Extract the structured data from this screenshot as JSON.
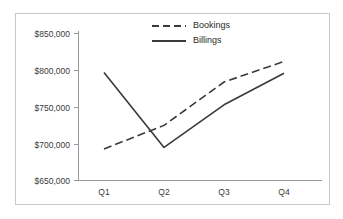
{
  "chart_data": {
    "type": "line",
    "title": "",
    "xlabel": "",
    "ylabel": "",
    "categories": [
      "Q1",
      "Q2",
      "Q3",
      "Q4"
    ],
    "ylim": [
      650000,
      850000
    ],
    "y_ticks": [
      850000,
      800000,
      750000,
      700000,
      650000
    ],
    "y_tick_labels": [
      "$850,000",
      "$800,000",
      "$750,000",
      "$700,000",
      "$650,000"
    ],
    "x_tick_labels": [
      "Q1",
      "Q2",
      "Q3",
      "Q4"
    ],
    "grid": false,
    "legend_position": "top-center",
    "series": [
      {
        "name": "Bookings",
        "style": "dashed",
        "color": "#3a3a3a",
        "values": [
          693000,
          725000,
          784000,
          812000
        ]
      },
      {
        "name": "Billings",
        "style": "solid",
        "color": "#3a3a3a",
        "values": [
          797000,
          695000,
          753000,
          796000
        ]
      }
    ]
  },
  "legend": {
    "items": [
      {
        "label": "Bookings",
        "style": "dashed"
      },
      {
        "label": "Billings",
        "style": "solid"
      }
    ]
  },
  "colors": {
    "line": "#3a3a3a",
    "axis": "#9a9a9a",
    "frame": "#c8c8c8",
    "background": "#ffffff",
    "text": "#2b2b2b"
  }
}
